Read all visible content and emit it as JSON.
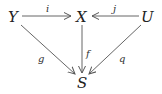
{
  "diagram": {
    "nodes": {
      "Y": "Y",
      "X": "X",
      "U": "U",
      "S": "S"
    },
    "edges": [
      {
        "from": "Y",
        "to": "X",
        "label": "i"
      },
      {
        "from": "U",
        "to": "X",
        "label": "j"
      },
      {
        "from": "Y",
        "to": "S",
        "label": "g"
      },
      {
        "from": "X",
        "to": "S",
        "label": "f"
      },
      {
        "from": "U",
        "to": "S",
        "label": "q"
      }
    ],
    "colors": {
      "arrow": "#666666",
      "text": "#222222"
    }
  }
}
